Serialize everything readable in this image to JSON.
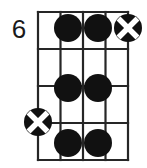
{
  "diagram": {
    "kind": "guitar-chord-diagram",
    "fret_number_label": "6",
    "colors": {
      "grid": "#262626",
      "dot_fill": "#111111",
      "marker_fill": "#111111",
      "marker_cross": "#ffffff",
      "background": "#ffffff",
      "text": "#1a1a1a"
    },
    "grid": {
      "strings": 5,
      "frets": 4,
      "left": 38,
      "right": 128,
      "top": 12,
      "bottom": 160,
      "string_x": [
        38,
        60.5,
        83,
        105.5,
        128
      ],
      "fret_y": [
        12,
        49,
        86,
        123,
        160
      ],
      "line_width": 2.2
    },
    "dots": [
      {
        "name": "dot-fret1-string2",
        "string_index": 1,
        "fret_index": 0,
        "cx": 68,
        "cy": 28,
        "r": 14
      },
      {
        "name": "dot-fret1-string3",
        "string_index": 2,
        "fret_index": 0,
        "cx": 98,
        "cy": 28,
        "r": 14
      },
      {
        "name": "dot-fret3-string2",
        "string_index": 1,
        "fret_index": 2,
        "cx": 68,
        "cy": 88,
        "r": 14
      },
      {
        "name": "dot-fret3-string3",
        "string_index": 2,
        "fret_index": 2,
        "cx": 98,
        "cy": 88,
        "r": 14
      },
      {
        "name": "dot-fret4-string2",
        "string_index": 1,
        "fret_index": 3,
        "cx": 68,
        "cy": 143,
        "r": 14
      },
      {
        "name": "dot-fret4-string3",
        "string_index": 2,
        "fret_index": 3,
        "cx": 98,
        "cy": 143,
        "r": 14
      }
    ],
    "cross_markers": [
      {
        "name": "cross-marker-top-right",
        "cx": 128,
        "cy": 28,
        "r": 14
      },
      {
        "name": "cross-marker-left",
        "cx": 38,
        "cy": 122,
        "r": 14
      }
    ]
  }
}
